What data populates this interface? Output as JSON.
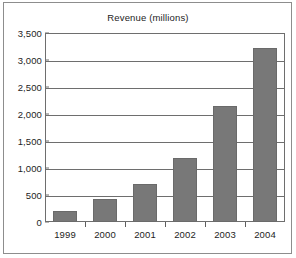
{
  "chart_data": {
    "type": "bar",
    "title": "Revenue (millions)",
    "xlabel": "",
    "ylabel": "",
    "categories": [
      "1999",
      "2000",
      "2001",
      "2002",
      "2003",
      "2004"
    ],
    "values": [
      210,
      420,
      700,
      1180,
      2140,
      3220
    ],
    "ylim": [
      0,
      3500
    ],
    "ytick_values": [
      0,
      500,
      1000,
      1500,
      2000,
      2500,
      3000,
      3500
    ],
    "ytick_labels": [
      "0",
      "500",
      "1,000",
      "1,500",
      "2,000",
      "2,500",
      "3,000",
      "3,500"
    ],
    "grid": true,
    "legend": false,
    "legend_position": "none",
    "series": [
      {
        "name": "Revenue",
        "values": [
          210,
          420,
          700,
          1180,
          2140,
          3220
        ]
      }
    ],
    "colors": {
      "bar_fill": "#787878",
      "bar_stroke": "#6a6a6a",
      "gridline": "#6e6e6e",
      "axis": "#6e6e6e",
      "text": "#1d1d1d",
      "frame": "#8d8d8d",
      "background": "#ffffff"
    }
  }
}
